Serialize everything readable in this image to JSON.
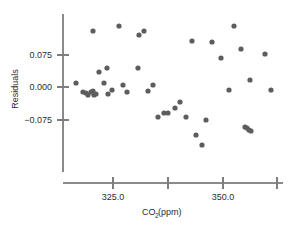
{
  "chart_data": {
    "type": "scatter",
    "title": "",
    "xlabel": "CO2(ppm)",
    "xlabel_main": "CO",
    "xlabel_sub": "2",
    "xlabel_tail": "(ppm)",
    "ylabel": "Residuals",
    "xlim": [
      315.5,
      358.0
    ],
    "ylim": [
      -0.145,
      0.125
    ],
    "grid": false,
    "legend": false,
    "xticks": [
      325.0,
      337.5,
      350.0,
      362.5
    ],
    "xtick_labels": [
      "325.0",
      "",
      "350.0",
      ""
    ],
    "yticks": [
      0.075,
      0.0,
      -0.075
    ],
    "ytick_labels": [
      "0.075",
      "0.000",
      "−0.075"
    ],
    "marker_color": "#5d5d5d",
    "axis_color": "#8a8a8a",
    "n_points": 44,
    "x": [
      317.2,
      318.8,
      319.3,
      319.6,
      320.3,
      320.6,
      321.0,
      321.4,
      322.0,
      322.6,
      323.4,
      324.2,
      324.7,
      325.5,
      326.1,
      326.6,
      327.4,
      328.3,
      329.2,
      330.0,
      330.8,
      331.6,
      332.4,
      334.3,
      335.3,
      336.4,
      337.3,
      338.1,
      339.0,
      340.0,
      341.0,
      342.2,
      343.5,
      344.7,
      345.9,
      347.0,
      348.2,
      349.4,
      350.6,
      351.6,
      352.7,
      353.4,
      353.8,
      355.8
    ],
    "y": [
      -0.008,
      -0.028,
      -0.031,
      -0.036,
      -0.028,
      -0.026,
      0.105,
      0.012,
      -0.008,
      0.043,
      -0.034,
      -0.023,
      0.116,
      -0.003,
      -0.028,
      0.095,
      0.043,
      0.105,
      -0.026,
      -0.002,
      -0.072,
      -0.064,
      -0.066,
      -0.055,
      -0.038,
      -0.072,
      0.096,
      -0.112,
      -0.134,
      -0.079,
      0.093,
      0.056,
      -0.023,
      0.108,
      0.08,
      0.015,
      -0.096,
      -0.099,
      0.1,
      -0.023,
      0.0,
      0.0,
      0.0,
      0.0
    ]
  },
  "points_px": [
    {
      "cx": 76,
      "cy": 83
    },
    {
      "cx": 83,
      "cy": 92
    },
    {
      "cx": 86,
      "cy": 93
    },
    {
      "cx": 88,
      "cy": 95
    },
    {
      "cx": 91,
      "cy": 92
    },
    {
      "cx": 93,
      "cy": 91
    },
    {
      "cx": 93,
      "cy": 31
    },
    {
      "cx": 99,
      "cy": 72
    },
    {
      "cx": 104,
      "cy": 83
    },
    {
      "cx": 107,
      "cy": 68
    },
    {
      "cx": 108,
      "cy": 94
    },
    {
      "cx": 112,
      "cy": 90
    },
    {
      "cx": 119,
      "cy": 26
    },
    {
      "cx": 123,
      "cy": 85
    },
    {
      "cx": 127,
      "cy": 92
    },
    {
      "cx": 139,
      "cy": 35
    },
    {
      "cx": 138,
      "cy": 68
    },
    {
      "cx": 144,
      "cy": 31
    },
    {
      "cx": 148,
      "cy": 91
    },
    {
      "cx": 153,
      "cy": 85
    },
    {
      "cx": 158,
      "cy": 117
    },
    {
      "cx": 164,
      "cy": 113
    },
    {
      "cx": 168,
      "cy": 113
    },
    {
      "cx": 175,
      "cy": 108
    },
    {
      "cx": 180,
      "cy": 102
    },
    {
      "cx": 186,
      "cy": 117
    },
    {
      "cx": 192,
      "cy": 41
    },
    {
      "cx": 196,
      "cy": 135
    },
    {
      "cx": 202,
      "cy": 145
    },
    {
      "cx": 206,
      "cy": 120
    },
    {
      "cx": 212,
      "cy": 42
    },
    {
      "cx": 221,
      "cy": 58
    },
    {
      "cx": 229,
      "cy": 90
    },
    {
      "cx": 234,
      "cy": 26
    },
    {
      "cx": 241,
      "cy": 49
    },
    {
      "cx": 250,
      "cy": 80
    },
    {
      "cx": 245,
      "cy": 127
    },
    {
      "cx": 249,
      "cy": 130
    },
    {
      "cx": 265,
      "cy": 54
    },
    {
      "cx": 271,
      "cy": 90
    },
    {
      "cx": 94,
      "cy": 95
    },
    {
      "cx": 96,
      "cy": 94
    },
    {
      "cx": 247,
      "cy": 128
    },
    {
      "cx": 251,
      "cy": 131
    }
  ],
  "axes_px": {
    "y_axis_x": 63,
    "y_axis_top": 14,
    "y_axis_bottom": 172,
    "x_axis_y": 183,
    "x_axis_left": 63,
    "x_axis_right": 283,
    "ytick_y": [
      55,
      87,
      120
    ],
    "xtick_x": [
      113,
      168,
      223,
      277
    ]
  }
}
